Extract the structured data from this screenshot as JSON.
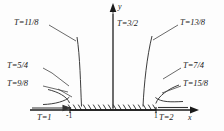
{
  "figure": {
    "title": "",
    "axes": {
      "x_label": "x",
      "y_label": "y"
    },
    "tick_labels": [
      {
        "text": "-1",
        "value": -1
      },
      {
        "text": "1",
        "value": 1
      }
    ],
    "branch_cut": {
      "description": "hatched-segment",
      "from": -1,
      "to": 1
    },
    "curve_labels": [
      {
        "id": "t-1",
        "text": "T=1",
        "value": "1"
      },
      {
        "id": "t-9-8",
        "text": "T=9/8",
        "value": "9/8"
      },
      {
        "id": "t-5-4",
        "text": "T=5/4",
        "value": "5/4"
      },
      {
        "id": "t-11-8",
        "text": "T=11/8",
        "value": "11/8"
      },
      {
        "id": "t-3-2",
        "text": "T=3/2",
        "value": "3/2"
      },
      {
        "id": "t-13-8",
        "text": "T=13/8",
        "value": "13/8"
      },
      {
        "id": "t-7-4",
        "text": "T=7/4",
        "value": "7/4"
      },
      {
        "id": "t-15-8",
        "text": "T=15/8",
        "value": "15/8"
      },
      {
        "id": "t-2",
        "text": "T=2",
        "value": "2"
      }
    ],
    "colors": {
      "ink": "#1a1a1a",
      "curve": "#333333",
      "background": "#fdfdfd"
    }
  }
}
